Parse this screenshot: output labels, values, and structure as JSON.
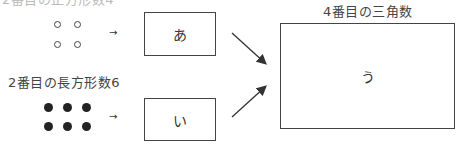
{
  "top_label_partial": "2番目の正方形数4",
  "middle_label": "2番目の長方形数6",
  "right_label": "4番目の三角数",
  "box_a": "あ",
  "box_i": "い",
  "box_u": "う",
  "arrow_glyph": "→",
  "top_figure": {
    "type": "open-circles",
    "rows": 2,
    "cols": 2
  },
  "bottom_figure": {
    "type": "filled-circles",
    "rows": 2,
    "cols": 3
  }
}
